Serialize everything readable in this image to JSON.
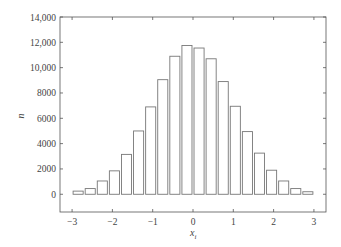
{
  "chart_data": {
    "type": "bar",
    "title": "",
    "xlabel": "x_i",
    "ylabel": "n",
    "xlim": [
      -3.3,
      3.3
    ],
    "ylim": [
      -1400,
      14000
    ],
    "x_ticks": [
      -3,
      -2,
      -1,
      0,
      1,
      2,
      3
    ],
    "x_tick_labels": [
      "−3",
      "−2",
      "−1",
      "0",
      "1",
      "2",
      "3"
    ],
    "y_ticks": [
      0,
      2000,
      4000,
      6000,
      8000,
      10000,
      12000,
      14000
    ],
    "y_tick_labels": [
      "0",
      "2000",
      "4000",
      "6000",
      "8000",
      "10,000",
      "12,000",
      "14,000"
    ],
    "bar_width": 0.25,
    "x": [
      -2.85,
      -2.55,
      -2.25,
      -1.95,
      -1.65,
      -1.35,
      -1.05,
      -0.75,
      -0.45,
      -0.15,
      0.15,
      0.45,
      0.75,
      1.05,
      1.35,
      1.65,
      1.95,
      2.25,
      2.55,
      2.85
    ],
    "values": [
      250,
      450,
      1050,
      1850,
      3150,
      5000,
      6900,
      9050,
      10900,
      11750,
      11550,
      10700,
      8900,
      6950,
      4950,
      3250,
      1900,
      1050,
      450,
      200
    ],
    "grid": false,
    "legend": null,
    "bar_fill": "#ffffff",
    "bar_stroke": "#777777",
    "axis_color": "#555555"
  },
  "labels": {
    "xlabel_main": "x",
    "xlabel_sub": "i",
    "ylabel": "n"
  }
}
